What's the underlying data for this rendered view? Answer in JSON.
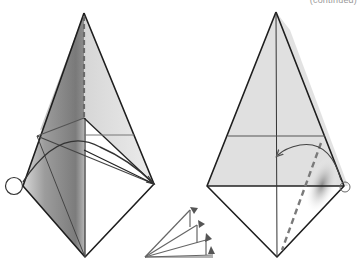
{
  "page": {
    "caption": "(continued)"
  },
  "diagrams": [
    {
      "id": "left-step",
      "description": "Kite-shaped origami base with shaded left flap, center dashed valley line, crease lines and a fold arc; circled left corner",
      "fill_colors": {
        "paper_light": "#e2e2e2",
        "paper_shade": "#8a8a8a",
        "white": "#ffffff"
      },
      "vertices": {
        "top": [
          84,
          13
        ],
        "left": [
          23,
          186
        ],
        "right": [
          154,
          184
        ],
        "bottom": [
          85,
          257
        ]
      },
      "markers": [
        "circle-left-corner",
        "dashed-center-line",
        "fold-arc"
      ]
    },
    {
      "id": "right-step",
      "description": "Kite-shaped origami base with horizontal crease, dashed fold line on right lower flap and curved arrow pointing left; circled right corner",
      "fill_colors": {
        "paper_light": "#e0e0e0",
        "white": "#ffffff"
      },
      "vertices": {
        "top": [
          276,
          12
        ],
        "left": [
          207,
          186
        ],
        "right": [
          344,
          186
        ],
        "bottom": [
          277,
          257
        ]
      },
      "markers": [
        "circle-right-corner",
        "dashed-fold-line",
        "curved-arrow"
      ]
    },
    {
      "id": "fan-fold-symbol",
      "description": "Repeat/fan-fold symbol: four stacked flaps with arrowheads",
      "count": 4
    }
  ]
}
